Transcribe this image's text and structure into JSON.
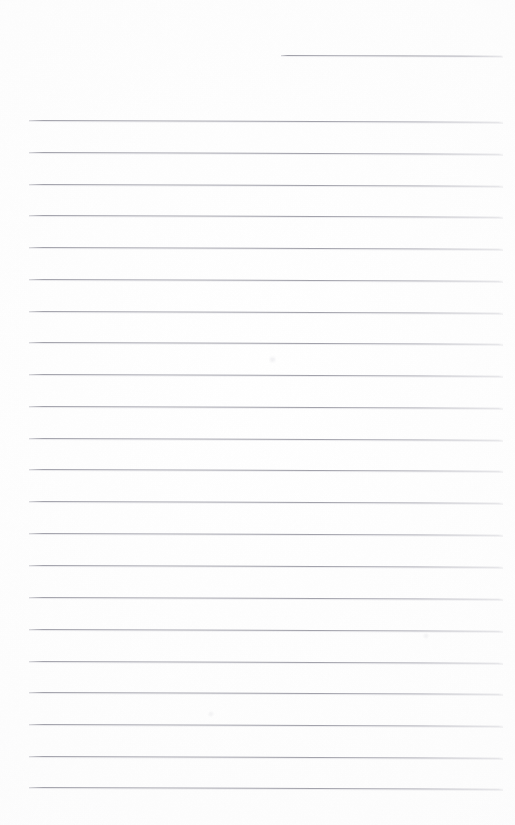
{
  "document": {
    "type": "scanned-lined-paper",
    "title": "Blank ruled notebook page",
    "page_width": 515,
    "page_height": 825,
    "background_color": "#fefefe",
    "rule_color": "#9a9aa4",
    "rule_thickness_px": 1,
    "content_text": "",
    "has_handwriting": false,
    "has_margin_rule": false,
    "line_count": 23,
    "line_spacing_px": 31.8,
    "skew_degrees": 0.22
  },
  "rules": [
    {
      "name": "rule-line-1",
      "y": 55,
      "x_start": 281,
      "x_end": 503,
      "short": true
    },
    {
      "name": "rule-line-2",
      "y": 120,
      "x_start": 29,
      "x_end": 503,
      "short": false
    },
    {
      "name": "rule-line-3",
      "y": 152,
      "x_start": 29,
      "x_end": 503,
      "short": false
    },
    {
      "name": "rule-line-4",
      "y": 184,
      "x_start": 29,
      "x_end": 503,
      "short": false
    },
    {
      "name": "rule-line-5",
      "y": 215,
      "x_start": 29,
      "x_end": 503,
      "short": false
    },
    {
      "name": "rule-line-6",
      "y": 247,
      "x_start": 29,
      "x_end": 503,
      "short": false
    },
    {
      "name": "rule-line-7",
      "y": 279,
      "x_start": 29,
      "x_end": 503,
      "short": false
    },
    {
      "name": "rule-line-8",
      "y": 311,
      "x_start": 29,
      "x_end": 503,
      "short": false
    },
    {
      "name": "rule-line-9",
      "y": 342,
      "x_start": 29,
      "x_end": 503,
      "short": false
    },
    {
      "name": "rule-line-10",
      "y": 374,
      "x_start": 29,
      "x_end": 503,
      "short": false
    },
    {
      "name": "rule-line-11",
      "y": 406,
      "x_start": 29,
      "x_end": 503,
      "short": false
    },
    {
      "name": "rule-line-12",
      "y": 438,
      "x_start": 29,
      "x_end": 503,
      "short": false
    },
    {
      "name": "rule-line-13",
      "y": 469,
      "x_start": 29,
      "x_end": 503,
      "short": false
    },
    {
      "name": "rule-line-14",
      "y": 501,
      "x_start": 29,
      "x_end": 503,
      "short": false
    },
    {
      "name": "rule-line-15",
      "y": 533,
      "x_start": 29,
      "x_end": 503,
      "short": false
    },
    {
      "name": "rule-line-16",
      "y": 565,
      "x_start": 29,
      "x_end": 503,
      "short": false
    },
    {
      "name": "rule-line-17",
      "y": 597,
      "x_start": 29,
      "x_end": 503,
      "short": false
    },
    {
      "name": "rule-line-18",
      "y": 629,
      "x_start": 29,
      "x_end": 503,
      "short": false
    },
    {
      "name": "rule-line-19",
      "y": 661,
      "x_start": 29,
      "x_end": 503,
      "short": false
    },
    {
      "name": "rule-line-20",
      "y": 692,
      "x_start": 29,
      "x_end": 503,
      "short": false
    },
    {
      "name": "rule-line-21",
      "y": 724,
      "x_start": 29,
      "x_end": 503,
      "short": false
    },
    {
      "name": "rule-line-22",
      "y": 756,
      "x_start": 29,
      "x_end": 503,
      "short": false
    },
    {
      "name": "rule-line-23",
      "y": 787,
      "x_start": 29,
      "x_end": 503,
      "short": false
    }
  ],
  "artifacts": [
    {
      "name": "scan-smudge-1",
      "x": 270,
      "y": 357,
      "size": 5
    },
    {
      "name": "scan-smudge-2",
      "x": 424,
      "y": 634,
      "size": 4
    },
    {
      "name": "scan-smudge-3",
      "x": 209,
      "y": 712,
      "size": 4
    }
  ]
}
